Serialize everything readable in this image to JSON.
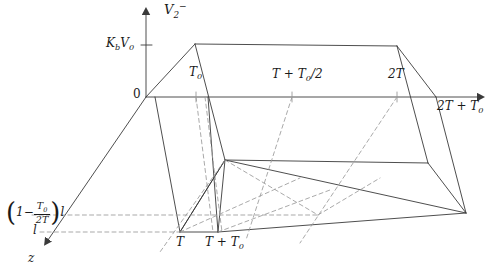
{
  "figure": {
    "type": "3d-oblique-waveform-diagram",
    "stroke_color": "#3a3a3a",
    "dash_color": "#8a8a8a",
    "background": "#ffffff"
  },
  "axes": {
    "vertical": {
      "label_base": "V",
      "label_sub": "2",
      "label_sup": "−",
      "x": 146,
      "y_top": 8,
      "y_origin": 97
    },
    "horizontal": {
      "x_start": 146,
      "x_end": 436,
      "y": 97
    },
    "depth": {
      "label": "z",
      "x_start": 146,
      "y_start": 97,
      "x_end": 40,
      "y_end": 252
    }
  },
  "labels": {
    "origin": "0",
    "y_tick": {
      "base": "K",
      "sub": "b",
      "base2": "V",
      "sub2": "0"
    },
    "t0": {
      "base": "T",
      "sub": "0"
    },
    "t_plus_t0_half": {
      "text": "T + T",
      "sub": "0",
      "tail": "/2"
    },
    "two_t": "2T",
    "two_t_plus_t0": {
      "text": "2T + T",
      "sub": "0"
    },
    "t_bottom": "T",
    "t_plus_t0_bottom": {
      "text": "T + T",
      "sub": "0"
    },
    "l_plain": "l",
    "l_scaled": {
      "open": "(",
      "one": "1",
      "minus": "−",
      "num": "T",
      "num_sub": "0",
      "den": "2T",
      "close": ")",
      "tail": "l"
    }
  },
  "tick_positions": {
    "t0_axis_x": 196,
    "t_plus_t0_half_axis_x": 292,
    "two_t_axis_x": 397,
    "kbv0_y": 45,
    "t_bottom_x": 180,
    "t_plus_t0_bottom_x": 218,
    "dash_row_upper_y": 215,
    "dash_row_lower_y": 232
  },
  "vertices": {
    "origin": [
      146,
      97
    ],
    "top_peak": [
      195,
      44
    ],
    "top_plateau_end": [
      397,
      46
    ],
    "axis_end_right": [
      436,
      97
    ],
    "front_base_left": [
      180,
      232
    ],
    "front_base_right": [
      218,
      232
    ],
    "front_peak": [
      225,
      160
    ],
    "mid_upper_dash_left": [
      146,
      215
    ],
    "depth_arrow_tip": [
      40,
      252
    ]
  }
}
